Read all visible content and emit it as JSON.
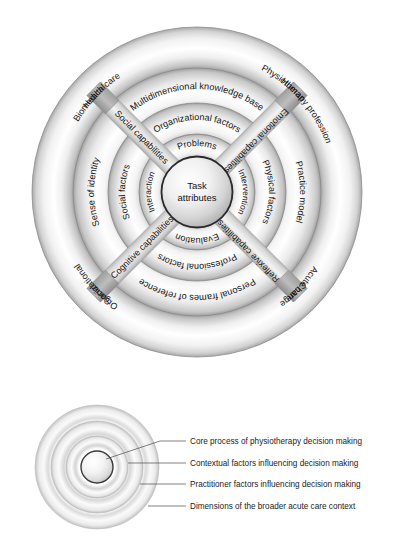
{
  "figure": {
    "type": "concentric-ring-diagram"
  },
  "main_diagram": {
    "core": {
      "label": "Task\nattributes",
      "line1": "Task",
      "line2": "attributes"
    },
    "ring_core_process": {
      "name": "Core process of physiotherapy decision making",
      "labels": {
        "top": "Problems",
        "right": "Intervention",
        "bottom": "Evaluation",
        "left": "Interaction"
      }
    },
    "ring_contextual": {
      "name": "Contextual factors influencing decision making",
      "labels": {
        "top": "Organizational factors",
        "right": "Physical factors",
        "bottom": "Professional factors",
        "left": "Social factors"
      }
    },
    "ring_practitioner": {
      "name": "Practitioner factors influencing decision making",
      "labels": {
        "top": "Multidimensional knowledge base",
        "right": "Practice model",
        "bottom": "Personal frames of reference",
        "left": "Sense of identity"
      }
    },
    "ring_broader_context": {
      "name": "Dimensions of the broader acute care context",
      "labels": {
        "top_left": "Health care",
        "top_right": "Human",
        "right_upper": "Physiotherapy profession",
        "right_lower": "Acute care",
        "bottom_right": "Change",
        "bottom_left": "Social",
        "left_lower": "Organizational",
        "left_upper": "Biomedical"
      }
    },
    "capability_bars": {
      "top_left": "Cognitive capabilities",
      "top_right": "Emotional capabilities",
      "bottom_left": "Social capabilities",
      "bottom_right": "Reflexive capabilities"
    }
  },
  "legend": {
    "items": [
      {
        "id": "core-process",
        "label": "Core process of physiotherapy decision making"
      },
      {
        "id": "contextual-factors",
        "label": "Contextual factors influencing decision making"
      },
      {
        "id": "practitioner-factors",
        "label": "Practitioner factors influencing decision making"
      },
      {
        "id": "broader-context",
        "label": "Dimensions of the broader acute care context"
      }
    ]
  },
  "colors": {
    "ring_light": "#fdfdfd",
    "ring_mid": "#c9c9c9",
    "ring_dark": "#9a9a9a",
    "bar_fill": "#b0b0b0",
    "outline": "#6e6e6e",
    "text": "#141414",
    "background": "#ffffff"
  }
}
